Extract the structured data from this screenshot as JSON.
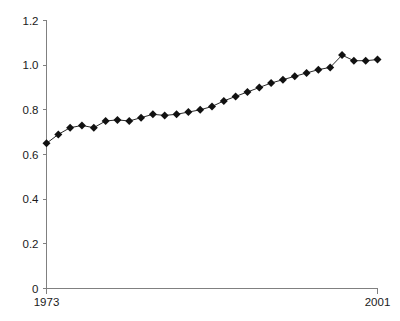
{
  "chart_data": {
    "type": "line",
    "title": "",
    "subtitle": "",
    "xlabel": "",
    "ylabel": "",
    "grid": false,
    "legend": "none",
    "marker": "diamond",
    "marker_color": "#111111",
    "line_color": "#111111",
    "axis_color": "#808080",
    "xlim": [
      1973,
      2001
    ],
    "ylim": [
      0,
      1.2
    ],
    "y_ticks": [
      0,
      0.2,
      0.4,
      0.6,
      0.8,
      1.0,
      1.2
    ],
    "y_tick_labels": [
      "0",
      "0.2",
      "0.4",
      "0.6",
      "0.8",
      "1.0",
      "1.2"
    ],
    "x_ticks": [
      1973,
      2001
    ],
    "x_tick_labels": [
      "1973",
      "2001"
    ],
    "x": [
      1973,
      1974,
      1975,
      1976,
      1977,
      1978,
      1979,
      1980,
      1981,
      1982,
      1983,
      1984,
      1985,
      1986,
      1987,
      1988,
      1989,
      1990,
      1991,
      1992,
      1993,
      1994,
      1995,
      1996,
      1997,
      1998,
      1999,
      2000,
      2001
    ],
    "values": [
      0.65,
      0.69,
      0.72,
      0.73,
      0.72,
      0.75,
      0.755,
      0.75,
      0.765,
      0.78,
      0.775,
      0.78,
      0.79,
      0.8,
      0.815,
      0.84,
      0.86,
      0.88,
      0.9,
      0.92,
      0.935,
      0.95,
      0.965,
      0.98,
      0.99,
      1.045,
      1.02,
      1.02,
      1.025
    ]
  }
}
